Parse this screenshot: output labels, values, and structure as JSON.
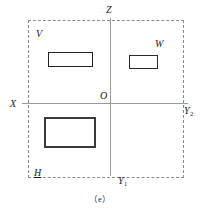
{
  "figure": {
    "caption": "（e）",
    "width": 200,
    "height": 208,
    "background_color": "#ffffff"
  },
  "axes": {
    "origin_label": "O",
    "x_axis_label": "X",
    "z_axis_label": "Z",
    "y1_axis_label_base": "Y",
    "y1_axis_label_sub": "1",
    "y2_axis_label_base": "Y",
    "y2_axis_label_sub": "2",
    "axis_color": "#9a9a9a",
    "boundary_color": "#8d8d8d",
    "boundary_style": "dashed"
  },
  "regions": [
    {
      "id": "quadrant-upper-left",
      "label": "V",
      "description": "upper-left quadrant containing a wide thin rectangle"
    },
    {
      "id": "quadrant-upper-right",
      "label": "W",
      "description": "upper-right quadrant containing a small rectangle"
    },
    {
      "id": "quadrant-lower-left",
      "label": "H",
      "description": "lower-left quadrant containing a large rectangle"
    }
  ],
  "boxes": [
    {
      "id": "box-v",
      "label": "V",
      "outline_color": "#222222"
    },
    {
      "id": "box-w",
      "label": "W",
      "outline_color": "#2b2b2b"
    },
    {
      "id": "box-h",
      "label": "H",
      "outline_color": "#3a3a3a"
    }
  ]
}
